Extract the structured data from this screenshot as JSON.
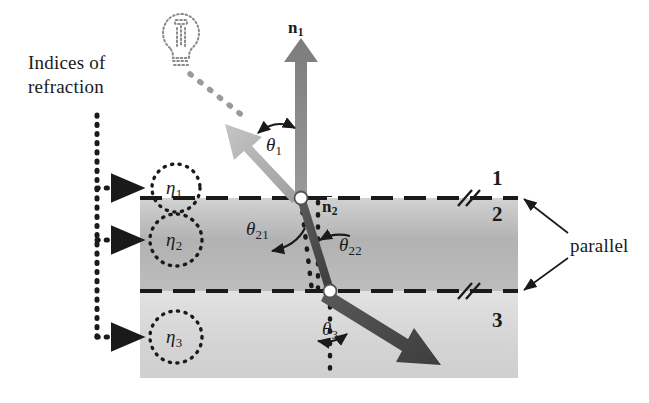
{
  "figure": {
    "type": "physics-optics-diagram",
    "background_color": "#ffffff",
    "ink_color": "#1a1a1a"
  },
  "annotations": {
    "title_line1": "Indices of",
    "title_line2": "refraction",
    "parallel_label": "parallel"
  },
  "indices": [
    {
      "id": "eta1",
      "symbol": "η",
      "subscript": "1",
      "x": 176,
      "y": 188
    },
    {
      "id": "eta2",
      "symbol": "η",
      "subscript": "2",
      "x": 176,
      "y": 240
    },
    {
      "id": "eta3",
      "symbol": "η",
      "subscript": "3",
      "x": 176,
      "y": 337
    }
  ],
  "regions": [
    {
      "label": "1",
      "x": 492,
      "y": 178
    },
    {
      "label": "2",
      "x": 492,
      "y": 212
    },
    {
      "label": "3",
      "x": 492,
      "y": 318
    }
  ],
  "normals": [
    {
      "id": "n1",
      "symbol": "n",
      "subscript": "1",
      "overline": false,
      "x": 288,
      "y": 22
    },
    {
      "id": "n2",
      "symbol": "n",
      "subscript": "2",
      "overline": true,
      "x": 324,
      "y": 200
    }
  ],
  "angles": [
    {
      "id": "theta1",
      "symbol": "θ",
      "subscript": "1",
      "x": 268,
      "y": 137
    },
    {
      "id": "theta21",
      "symbol": "θ",
      "subscript": "21",
      "x": 248,
      "y": 222
    },
    {
      "id": "theta22",
      "symbol": "θ",
      "subscript": "22",
      "x": 337,
      "y": 238
    },
    {
      "id": "theta3",
      "symbol": "θ",
      "subscript": "3",
      "x": 325,
      "y": 325
    }
  ],
  "colors": {
    "ink": "#1a1a1a",
    "layer1_fill": "#ffffff",
    "layer2_fill": "#b9b9b9",
    "layer3_fill": "#dcdcdc",
    "incident_ray": "#b0b0b0",
    "refracted_ray": "#4a4a4a",
    "normal_arrow": "#8c8c8c",
    "node_fill": "#ffffff"
  },
  "geometry": {
    "slab_left": 140,
    "slab_right": 518,
    "boundary_top_y": 198,
    "boundary_bottom_y": 291,
    "slab_bottom_y": 378,
    "node_top": {
      "x": 301,
      "y": 198
    },
    "node_bottom": {
      "x": 330,
      "y": 291
    }
  },
  "elements": {
    "light_bulb": "light-bulb-icon",
    "dotted_ray": "incident-light-path",
    "reflected_arrow": "reflected-ray-arrow",
    "normal_arrow": "surface-normal-arrow",
    "refracted_arrow": "refracted-ray-arrow",
    "parallel_ticks": "parallel-tick-marks"
  }
}
